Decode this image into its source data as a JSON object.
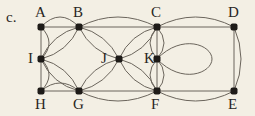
{
  "part_label": "c.",
  "colors": {
    "background": "#f3efe4",
    "edge": "#6b655c",
    "node": "#1e1b18",
    "text": "#2a2622"
  },
  "nodes": [
    {
      "id": "A",
      "x": 41,
      "y": 27,
      "lx": 35,
      "ly": 5
    },
    {
      "id": "B",
      "x": 79,
      "y": 27,
      "lx": 73,
      "ly": 5
    },
    {
      "id": "C",
      "x": 157,
      "y": 27,
      "lx": 151,
      "ly": 5
    },
    {
      "id": "D",
      "x": 234,
      "y": 27,
      "lx": 228,
      "ly": 5
    },
    {
      "id": "I",
      "x": 41,
      "y": 59,
      "lx": 28,
      "ly": 51
    },
    {
      "id": "J",
      "x": 119,
      "y": 59,
      "lx": 101,
      "ly": 51
    },
    {
      "id": "K",
      "x": 157,
      "y": 59,
      "lx": 144,
      "ly": 51
    },
    {
      "id": "H",
      "x": 41,
      "y": 91,
      "lx": 35,
      "ly": 97
    },
    {
      "id": "G",
      "x": 79,
      "y": 91,
      "lx": 73,
      "ly": 97
    },
    {
      "id": "F",
      "x": 157,
      "y": 91,
      "lx": 151,
      "ly": 97
    },
    {
      "id": "E",
      "x": 234,
      "y": 91,
      "lx": 228,
      "ly": 97
    }
  ],
  "edges": [
    {
      "from": "A",
      "to": "B",
      "type": "line"
    },
    {
      "from": "A",
      "to": "B",
      "type": "arc",
      "bend": -10
    },
    {
      "from": "A",
      "to": "I",
      "type": "line"
    },
    {
      "from": "A",
      "to": "I",
      "type": "arc",
      "bend": -8
    },
    {
      "from": "I",
      "to": "H",
      "type": "line"
    },
    {
      "from": "I",
      "to": "H",
      "type": "arc",
      "bend": -8
    },
    {
      "from": "H",
      "to": "G",
      "type": "line"
    },
    {
      "from": "H",
      "to": "G",
      "type": "arc",
      "bend": -8
    },
    {
      "from": "I",
      "to": "B",
      "type": "arc",
      "bend": 6
    },
    {
      "from": "I",
      "to": "B",
      "type": "arc",
      "bend": -6
    },
    {
      "from": "I",
      "to": "G",
      "type": "arc",
      "bend": 6
    },
    {
      "from": "I",
      "to": "G",
      "type": "arc",
      "bend": -6
    },
    {
      "from": "B",
      "to": "C",
      "type": "line"
    },
    {
      "from": "B",
      "to": "C",
      "type": "arc",
      "bend": -10
    },
    {
      "from": "G",
      "to": "F",
      "type": "line"
    },
    {
      "from": "G",
      "to": "F",
      "type": "arc",
      "bend": 10
    },
    {
      "from": "B",
      "to": "J",
      "type": "arc",
      "bend": 6
    },
    {
      "from": "B",
      "to": "J",
      "type": "arc",
      "bend": -6
    },
    {
      "from": "G",
      "to": "J",
      "type": "arc",
      "bend": 6
    },
    {
      "from": "G",
      "to": "J",
      "type": "arc",
      "bend": -6
    },
    {
      "from": "J",
      "to": "C",
      "type": "arc",
      "bend": 6
    },
    {
      "from": "J",
      "to": "C",
      "type": "arc",
      "bend": -6
    },
    {
      "from": "J",
      "to": "F",
      "type": "arc",
      "bend": 6
    },
    {
      "from": "J",
      "to": "F",
      "type": "arc",
      "bend": -6
    },
    {
      "from": "C",
      "to": "K",
      "type": "line"
    },
    {
      "from": "C",
      "to": "K",
      "type": "arc",
      "bend": 7
    },
    {
      "from": "C",
      "to": "K",
      "type": "arc",
      "bend": -7
    },
    {
      "from": "K",
      "to": "F",
      "type": "line"
    },
    {
      "from": "K",
      "to": "F",
      "type": "arc",
      "bend": 7
    },
    {
      "from": "K",
      "to": "F",
      "type": "arc",
      "bend": -7
    },
    {
      "from": "C",
      "to": "D",
      "type": "line"
    },
    {
      "from": "C",
      "to": "D",
      "type": "arc",
      "bend": -10
    },
    {
      "from": "F",
      "to": "E",
      "type": "line"
    },
    {
      "from": "F",
      "to": "E",
      "type": "arc",
      "bend": 10
    },
    {
      "from": "D",
      "to": "E",
      "type": "line"
    },
    {
      "from": "D",
      "to": "E",
      "type": "arc",
      "bend": -7
    },
    {
      "from": "K",
      "to": "K",
      "type": "loop"
    }
  ]
}
